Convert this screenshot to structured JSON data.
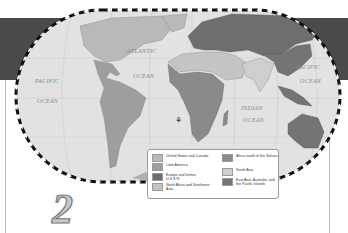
{
  "map": {
    "projection": "Robinson-style world map",
    "ocean_labels": [
      {
        "text": "ATLANTIC",
        "left": 127,
        "top": 48
      },
      {
        "text": "OCEAN",
        "left": 133,
        "top": 73
      },
      {
        "text": "PACIFIC",
        "left": 35,
        "top": 78
      },
      {
        "text": "OCEAN",
        "left": 37,
        "top": 98
      },
      {
        "text": "PACIFIC",
        "left": 296,
        "top": 64
      },
      {
        "text": "OCEAN",
        "left": 300,
        "top": 78
      },
      {
        "text": "INDIAN",
        "left": 241,
        "top": 105
      },
      {
        "text": "OCEAN",
        "left": 243,
        "top": 117
      }
    ],
    "compass_icon": "compass-rose"
  },
  "legend": {
    "items": [
      {
        "label": "United States and Canada",
        "color": "#b9b9b9"
      },
      {
        "label": "Latin America",
        "color": "#9e9e9e"
      },
      {
        "label": "Europe and former U.S.S.R.",
        "color": "#6e6e6e"
      },
      {
        "label": "North Africa and Southwest Asia",
        "color": "#c4c4c4"
      },
      {
        "label": "Africa south of the Sahara",
        "color": "#8a8a8a"
      },
      {
        "label": "South Asia",
        "color": "#cfcfcf"
      },
      {
        "label": "East Asia, Australia, and the Pacific Islands",
        "color": "#747474"
      }
    ]
  },
  "chapter_number": "2",
  "colors": {
    "banner": "#4a4a4a",
    "ocean": "#e2e2e2",
    "border_dash": "#111111"
  }
}
